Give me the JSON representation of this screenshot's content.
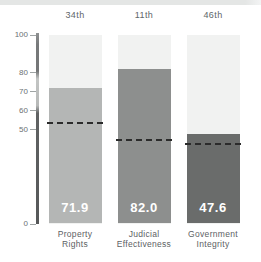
{
  "panel": {
    "top_strip_color": "#e4e6e5",
    "background_color": "#ffffff"
  },
  "chart_data": {
    "type": "bar",
    "title": "",
    "xlabel": "",
    "ylabel": "",
    "categories": [
      [
        "Property",
        "Rights"
      ],
      [
        "Judicial",
        "Effectiveness"
      ],
      [
        "Government",
        "Integrity"
      ]
    ],
    "rank_labels": [
      "34th",
      "11th",
      "46th"
    ],
    "values": [
      71.9,
      82.0,
      47.6
    ],
    "value_labels": [
      "71.9",
      "82.0",
      "47.6"
    ],
    "reference_line_values": [
      53,
      44,
      42
    ],
    "reference_line_style": "dashed",
    "ylim": [
      0,
      100
    ],
    "yticks": [
      100,
      80,
      70,
      60,
      50,
      0
    ],
    "grid": false,
    "legend_position": "none",
    "bar_colors": [
      "#b4b6b5",
      "#8d8f8e",
      "#6a6c6b"
    ],
    "column_background_color": "#f1f2f1",
    "dash_color": "#2b2b2b",
    "axis_color": "#606263",
    "tick_color": "#9fa4a4",
    "tick_label_color": "#6b7073",
    "rank_label_color": "#60666a",
    "category_label_color": "#5c6164",
    "value_label_color": "#ffffff"
  }
}
